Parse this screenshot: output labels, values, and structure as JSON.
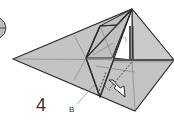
{
  "diagram": {
    "type": "origami-fold-diagram",
    "step_number": "4",
    "labels": {
      "point_b": "B"
    },
    "colors": {
      "paper": "#c4c4c4",
      "paper_light": "#d0d0d0",
      "edge": "#2a2a2a",
      "crease": "#7a7a7a",
      "flap_white": "#ffffff",
      "background": "#ffffff"
    },
    "symbols": [
      "partial-previous-step-arrow",
      "valley-fold-dashed-lines",
      "push-arrow",
      "leader-line-to-B"
    ]
  }
}
